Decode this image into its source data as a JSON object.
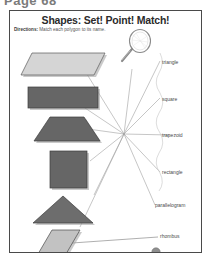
{
  "page": {
    "page_number_label": "Page 68"
  },
  "worksheet": {
    "title": "Shapes: Set! Point! Match!",
    "directions_label": "Directions:",
    "directions_text": "Match each polygon to its name.",
    "magnifier_icon": "magnifying-glass-icon",
    "colors": {
      "ink": "#4a4a4a",
      "title": "#2b2b2b",
      "shape_light": "#d5d5d5",
      "shape_dark": "#666666",
      "shape_mid": "#7a7a7a",
      "shape_outline": "#3d3d3d",
      "shadow": "#9a9a9a",
      "line": "#9b9b9b",
      "frame": "#4a4a4a"
    },
    "hub": {
      "x": 114,
      "y": 123
    },
    "words": [
      {
        "id": "triangle",
        "label": "triangle",
        "x": 163,
        "y": 52
      },
      {
        "id": "square",
        "label": "square",
        "x": 163,
        "y": 89
      },
      {
        "id": "trapezoid",
        "label": "trapezoid",
        "x": 163,
        "y": 126
      },
      {
        "id": "rectangle",
        "label": "rectangle",
        "x": 163,
        "y": 163
      },
      {
        "id": "parallelogram",
        "label": "parallelogram",
        "x": 163,
        "y": 196
      },
      {
        "id": "rhombus",
        "label": "rhombus",
        "x": 158,
        "y": 228
      }
    ],
    "shapes": [
      {
        "id": "parallelogram-shape",
        "name": "parallelogram",
        "fill": "#d5d5d5",
        "x": 18,
        "y": 40
      },
      {
        "id": "rectangle-shape",
        "name": "rectangle",
        "fill": "#666666",
        "x": 18,
        "y": 78
      },
      {
        "id": "trapezoid-shape",
        "name": "trapezoid",
        "fill": "#666666",
        "x": 18,
        "y": 110
      },
      {
        "id": "square-shape",
        "name": "square",
        "fill": "#666666",
        "x": 45,
        "y": 148
      },
      {
        "id": "triangle-shape",
        "name": "triangle",
        "fill": "#6d6d6d",
        "x": 30,
        "y": 188
      },
      {
        "id": "rhombus-shape",
        "name": "rhombus",
        "fill": "#c2c2c2",
        "x": 30,
        "y": 222
      }
    ],
    "rhombus_dot": {
      "id": "rhombus-dot",
      "x": 155,
      "y": 241
    }
  }
}
